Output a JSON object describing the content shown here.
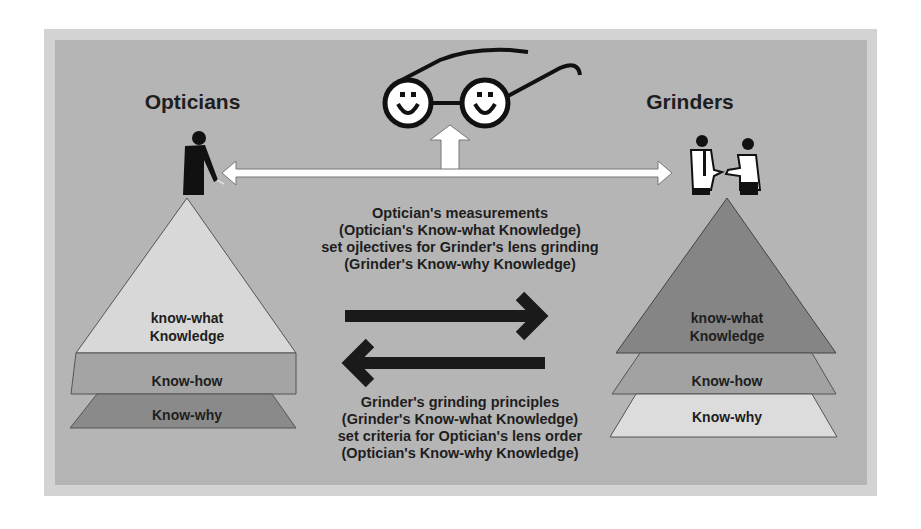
{
  "diagram": {
    "left_group": {
      "title": "Opticians",
      "icon": "person-bending-icon",
      "pyramid": {
        "top": {
          "line1": "know-what",
          "line2": "Knowledge",
          "color": "#d8d8d8"
        },
        "middle": {
          "label": "Know-how",
          "color": "#a4a4a4"
        },
        "bottom": {
          "label": "Know-why",
          "color": "#8a8a8a"
        }
      }
    },
    "right_group": {
      "title": "Grinders",
      "icon": "handshake-people-icon",
      "pyramid": {
        "top": {
          "line1": "know-what",
          "line2": "Knowledge",
          "color": "#858585"
        },
        "middle": {
          "label": "Know-how",
          "color": "#a2a2a2"
        },
        "bottom": {
          "label": "Know-why",
          "color": "#dcdcdc"
        }
      }
    },
    "center_icon": "smiley-glasses-icon",
    "top_caption": {
      "line1": "Optician's measurements",
      "line2": "(Optician's Know-what Knowledge)",
      "line3": "set ojlectives for Grinder's lens grinding",
      "line4": "(Grinder's Know-why Knowledge)"
    },
    "bottom_caption": {
      "line1": "Grinder's grinding principles",
      "line2": "(Grinder's Know-what Knowledge)",
      "line3": "set criteria for Optician's lens order",
      "line4": "(Optician's Know-why Knowledge)"
    },
    "colors": {
      "frame": "#d3d3d3",
      "panel": "#b5b5b5",
      "text": "#1e1e1e",
      "arrow_dark": "#1a1a1a",
      "arrow_light": "#ffffff"
    }
  }
}
